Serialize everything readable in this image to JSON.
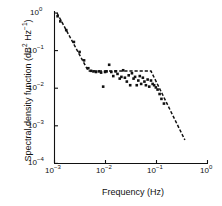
{
  "chart_data": {
    "type": "scatter",
    "title": "",
    "xlabel": "Frequency (Hz)",
    "ylabel": "Spectral density function (dB² Hz⁻¹)",
    "xscale": "log",
    "yscale": "log",
    "xlim": [
      0.001,
      1
    ],
    "ylim": [
      0.0001,
      1
    ],
    "grid": false,
    "legend": null,
    "x_tick_labels": [
      "10⁻³",
      "10⁻²",
      "10⁻¹",
      "10⁰"
    ],
    "x_tick_values": [
      0.001,
      0.01,
      0.1,
      1
    ],
    "y_tick_labels": [
      "10⁻⁴",
      "10⁻³",
      "10⁻²",
      "10⁻¹",
      "10⁰"
    ],
    "y_tick_values": [
      0.0001,
      0.001,
      0.01,
      0.1,
      1
    ],
    "series": [
      {
        "name": "measured spectral density",
        "style": "scatter",
        "marker": "square",
        "color": "#111111",
        "points": [
          [
            0.00115,
            0.82
          ],
          [
            0.0013,
            0.6
          ],
          [
            0.0017,
            0.35
          ],
          [
            0.0024,
            0.17
          ],
          [
            0.0031,
            0.092
          ],
          [
            0.0038,
            0.055
          ],
          [
            0.0046,
            0.034
          ],
          [
            0.0052,
            0.029
          ],
          [
            0.0058,
            0.028
          ],
          [
            0.0065,
            0.027
          ],
          [
            0.0074,
            0.028
          ],
          [
            0.0082,
            0.026
          ],
          [
            0.009,
            0.011
          ],
          [
            0.0098,
            0.027
          ],
          [
            0.0105,
            0.028
          ],
          [
            0.0118,
            0.042
          ],
          [
            0.013,
            0.027
          ],
          [
            0.0142,
            0.021
          ],
          [
            0.0158,
            0.028
          ],
          [
            0.0172,
            0.024
          ],
          [
            0.019,
            0.018
          ],
          [
            0.0205,
            0.02
          ],
          [
            0.0222,
            0.03
          ],
          [
            0.024,
            0.019
          ],
          [
            0.0262,
            0.015
          ],
          [
            0.0285,
            0.022
          ],
          [
            0.0305,
            0.012
          ],
          [
            0.033,
            0.025
          ],
          [
            0.0355,
            0.018
          ],
          [
            0.038,
            0.02
          ],
          [
            0.041,
            0.012
          ],
          [
            0.044,
            0.016
          ],
          [
            0.047,
            0.021
          ],
          [
            0.05,
            0.013
          ],
          [
            0.054,
            0.019
          ],
          [
            0.058,
            0.015
          ],
          [
            0.062,
            0.012
          ],
          [
            0.067,
            0.017
          ],
          [
            0.072,
            0.011
          ],
          [
            0.078,
            0.016
          ],
          [
            0.084,
            0.013
          ],
          [
            0.09,
            0.012
          ],
          [
            0.097,
            0.0105
          ],
          [
            0.105,
            0.0092
          ],
          [
            0.115,
            0.007
          ],
          [
            0.125,
            0.0052
          ],
          [
            0.14,
            0.0039
          ]
        ]
      },
      {
        "name": "fitted model",
        "style": "dashed-line",
        "color": "#111111",
        "points": [
          [
            0.00112,
            1.0
          ],
          [
            0.0046,
            0.0285
          ],
          [
            0.078,
            0.0285
          ],
          [
            0.36,
            0.00042
          ]
        ]
      }
    ]
  },
  "axes": {
    "x_title": "Frequency (Hz)",
    "y_title_main": "Spectral density function (dB",
    "y_title_sup1": "2",
    "y_title_mid": " Hz",
    "y_title_sup2": "−1",
    "y_title_end": ")"
  },
  "ticks": {
    "x": [
      {
        "base": "10",
        "exp": "−3"
      },
      {
        "base": "10",
        "exp": "−2"
      },
      {
        "base": "10",
        "exp": "−1"
      },
      {
        "base": "10",
        "exp": "0"
      }
    ],
    "y": [
      {
        "base": "10",
        "exp": "0"
      },
      {
        "base": "10",
        "exp": "−1"
      },
      {
        "base": "10",
        "exp": "−2"
      },
      {
        "base": "10",
        "exp": "−3"
      },
      {
        "base": "10",
        "exp": "−4"
      }
    ]
  },
  "colors": {
    "axis": "#111111",
    "marker": "#111111",
    "line": "#111111",
    "background": "#ffffff"
  }
}
